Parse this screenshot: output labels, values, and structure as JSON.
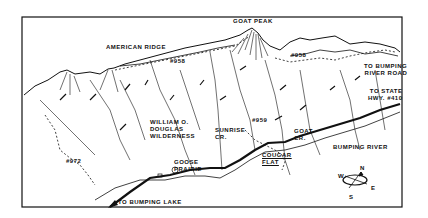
{
  "map": {
    "style": "hand-drawn black and white relief sketch",
    "colors": {
      "ink": "#111111",
      "paper": "#ffffff"
    },
    "labels": {
      "goat_peak": "GOAT PEAK",
      "american_ridge": "AMERICAN RIDGE",
      "trail_958_left": "#958",
      "trail_958_right": "#958",
      "to_bumping_river_road": "TO BUMPING\nRIVER ROAD",
      "to_state_hwy": "TO STATE\nHWY. #410",
      "wilderness": "WILLIAM O.\nDOUGLAS\nWILDERNESS",
      "sunrise_cr": "SUNRISE\nCR.",
      "trail_959": "#959",
      "goat_cr": "GOAT\nCR.",
      "trail_972": "#972",
      "goose_prairie": "GOOSE\nPRAIRIE",
      "cougar_flat": "COUGAR\nFLAT",
      "bumping_river": "BUMPING RIVER",
      "to_bumping_lake": "TO BUMPING LAKE"
    },
    "compass": {
      "n": "N",
      "s": "S",
      "e": "E",
      "w": "W"
    }
  }
}
